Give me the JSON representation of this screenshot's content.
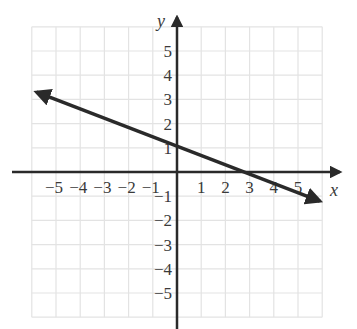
{
  "chart_data": {
    "type": "line",
    "title": "",
    "xlabel": "x",
    "ylabel": "y",
    "xlim": [
      -6,
      6
    ],
    "ylim": [
      -6,
      6
    ],
    "grid": true,
    "x_ticks": [
      "-5",
      "-4",
      "-3",
      "-2",
      "-1",
      "1",
      "2",
      "3",
      "4",
      "5"
    ],
    "y_ticks": [
      "5",
      "4",
      "3",
      "2",
      "1",
      "-1",
      "-2",
      "-3",
      "-4",
      "-5"
    ],
    "series": [
      {
        "name": "line",
        "arrows_both_ends": true,
        "points": [
          {
            "x": -5.8,
            "y": 3.3
          },
          {
            "x": 0,
            "y": 1.25
          },
          {
            "x": 3.3,
            "y": 0
          },
          {
            "x": 5.9,
            "y": -1.2
          }
        ],
        "slope": -0.38,
        "y_intercept": 1.25
      }
    ]
  },
  "labels": {
    "x_axis": "x",
    "y_axis": "y",
    "x_ticks": [
      {
        "v": -5,
        "t": "−5"
      },
      {
        "v": -4,
        "t": "−4"
      },
      {
        "v": -3,
        "t": "−3"
      },
      {
        "v": -2,
        "t": "−2"
      },
      {
        "v": -1,
        "t": "−1"
      },
      {
        "v": 1,
        "t": "1"
      },
      {
        "v": 2,
        "t": "2"
      },
      {
        "v": 3,
        "t": "3"
      },
      {
        "v": 4,
        "t": "4"
      },
      {
        "v": 5,
        "t": "5"
      }
    ],
    "y_ticks": [
      {
        "v": 5,
        "t": "5"
      },
      {
        "v": 4,
        "t": "4"
      },
      {
        "v": 3,
        "t": "3"
      },
      {
        "v": 2,
        "t": "2"
      },
      {
        "v": 1,
        "t": "1"
      },
      {
        "v": -1,
        "t": "−1"
      },
      {
        "v": -2,
        "t": "−2"
      },
      {
        "v": -3,
        "t": "−3"
      },
      {
        "v": -4,
        "t": "−4"
      },
      {
        "v": -5,
        "t": "−5"
      }
    ]
  }
}
